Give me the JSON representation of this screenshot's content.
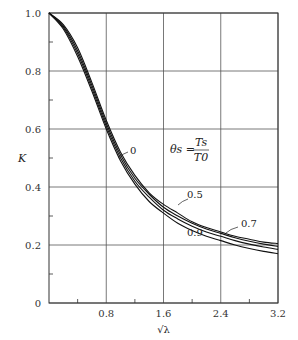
{
  "chart_data": {
    "type": "line",
    "title": "",
    "xlabel": "√λ",
    "ylabel": "K",
    "xlim": [
      0,
      3.2
    ],
    "ylim": [
      0,
      1.0
    ],
    "grid": true,
    "x_ticks": [
      "0.8",
      "1.6",
      "2.4",
      "3.2"
    ],
    "y_ticks": [
      "0",
      "0.2",
      "0.4",
      "0.6",
      "0.8",
      "1.0"
    ],
    "annotation": "θs = Ts / T0",
    "x": [
      0,
      0.2,
      0.4,
      0.6,
      0.8,
      1.0,
      1.2,
      1.4,
      1.6,
      1.8,
      2.0,
      2.2,
      2.4,
      2.6,
      2.8,
      3.0,
      3.2
    ],
    "series": [
      {
        "name": "0",
        "values": [
          1.0,
          0.96,
          0.88,
          0.76,
          0.63,
          0.52,
          0.44,
          0.38,
          0.34,
          0.31,
          0.28,
          0.26,
          0.245,
          0.23,
          0.22,
          0.21,
          0.205
        ]
      },
      {
        "name": "0.5",
        "values": [
          1.0,
          0.955,
          0.87,
          0.75,
          0.62,
          0.51,
          0.43,
          0.375,
          0.33,
          0.3,
          0.275,
          0.255,
          0.24,
          0.225,
          0.213,
          0.203,
          0.195
        ]
      },
      {
        "name": "0.7",
        "values": [
          1.0,
          0.95,
          0.86,
          0.74,
          0.61,
          0.5,
          0.42,
          0.365,
          0.32,
          0.29,
          0.265,
          0.245,
          0.23,
          0.215,
          0.203,
          0.193,
          0.185
        ]
      },
      {
        "name": "0.9",
        "values": [
          1.0,
          0.945,
          0.85,
          0.73,
          0.6,
          0.49,
          0.41,
          0.35,
          0.31,
          0.275,
          0.25,
          0.23,
          0.215,
          0.2,
          0.188,
          0.178,
          0.17
        ]
      }
    ]
  },
  "labels": {
    "y_axis": "K",
    "x_axis": "√λ",
    "theta_lhs": "θs =",
    "theta_num": "Ts",
    "theta_den": "T0"
  }
}
